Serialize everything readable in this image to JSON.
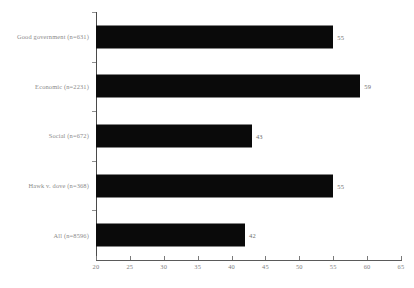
{
  "chart_data": {
    "type": "bar",
    "orientation": "horizontal",
    "title": "",
    "subtitle": "",
    "xlabel": "",
    "ylabel": "",
    "categories": [
      "Good government (n=631)",
      "Economic (n=2231)",
      "Social (n=672)",
      "Hawk v. dove (n=368)",
      "All (n=8596)"
    ],
    "values": [
      55,
      59,
      43,
      55,
      42
    ],
    "data_labels": [
      "55",
      "59",
      "43",
      "55",
      "42"
    ],
    "xlim": [
      20,
      65
    ],
    "xticks": [
      20,
      25,
      30,
      35,
      40,
      45,
      50,
      55,
      60,
      65
    ],
    "xtick_labels": [
      "20",
      "25",
      "30",
      "35",
      "40",
      "45",
      "50",
      "55",
      "60",
      "65"
    ],
    "grid": false,
    "legend": false,
    "bar_color": "#0a0a0a",
    "background_color": "#ffffff",
    "axis_color": "#5a5a5a"
  }
}
